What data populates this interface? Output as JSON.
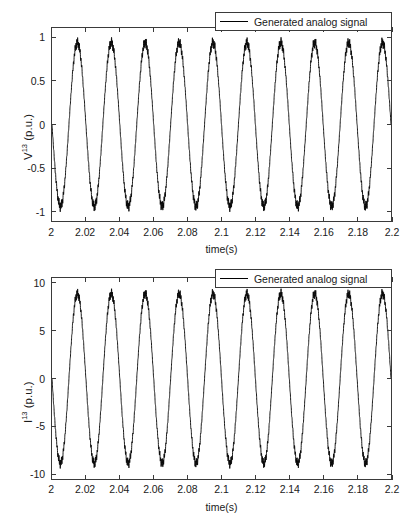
{
  "figure": {
    "background_color": "#ffffff",
    "axis_color": "#3a3a3a",
    "line_color": "#000000"
  },
  "chart_data": [
    {
      "type": "line",
      "panel": "top",
      "title": "",
      "xlabel": "time(s)",
      "ylabel": "V13 (p.u.)",
      "ylabel_base": "V",
      "ylabel_sup": "13",
      "ylabel_unit": " (p.u.)",
      "xlim": [
        2,
        2.2
      ],
      "ylim": [
        -1.12,
        1.12
      ],
      "xticks": [
        2,
        2.02,
        2.04,
        2.06,
        2.08,
        2.1,
        2.12,
        2.14,
        2.16,
        2.18,
        2.2
      ],
      "xticklabels": [
        "2",
        "2.02",
        "2.04",
        "2.06",
        "2.08",
        "2.1",
        "2.12",
        "2.14",
        "2.16",
        "2.18",
        "2.2"
      ],
      "yticks": [
        1,
        0.5,
        0,
        -0.5,
        -1
      ],
      "yticklabels": [
        "1",
        "0.5",
        "0",
        "-0.5",
        "-1"
      ],
      "grid": false,
      "legend_position": "top-right",
      "series": [
        {
          "name": "Generated analog signal",
          "waveform": "sine",
          "amplitude": 0.95,
          "frequency_hz": 50,
          "phase_deg": 180,
          "ripple_amplitude": 0.045,
          "ripple_frequency_hz": 2000,
          "color": "#000000"
        }
      ]
    },
    {
      "type": "line",
      "panel": "bottom",
      "title": "",
      "xlabel": "time(s)",
      "ylabel": "I13 (p.u.)",
      "ylabel_base": "I",
      "ylabel_sup": "13",
      "ylabel_unit": " (p.u.)",
      "xlim": [
        2,
        2.2
      ],
      "ylim": [
        -10.6,
        10.6
      ],
      "xticks": [
        2,
        2.02,
        2.04,
        2.06,
        2.08,
        2.1,
        2.12,
        2.14,
        2.16,
        2.18,
        2.2
      ],
      "xticklabels": [
        "2",
        "2.02",
        "2.04",
        "2.06",
        "2.08",
        "2.1",
        "2.12",
        "2.14",
        "2.16",
        "2.18",
        "2.2"
      ],
      "yticks": [
        10,
        5,
        0,
        -5,
        -10
      ],
      "yticklabels": [
        "10",
        "5",
        "0",
        "-5",
        "-10"
      ],
      "grid": false,
      "legend_position": "top-right",
      "series": [
        {
          "name": "Generated analog signal",
          "waveform": "sine",
          "amplitude": 8.95,
          "frequency_hz": 50,
          "phase_deg": 180,
          "ripple_amplitude": 0.38,
          "ripple_frequency_hz": 2000,
          "color": "#000000"
        }
      ]
    }
  ]
}
